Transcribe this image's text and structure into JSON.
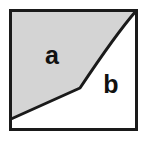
{
  "figure": {
    "canvas": {
      "width": 146,
      "height": 143
    },
    "background_color": "#ffffff",
    "frame": {
      "name": "bounding-box",
      "stroke_color": "#1a1a1a",
      "stroke_width": 3,
      "x": 10.5,
      "y": 10.5,
      "width": 126,
      "height": 119
    },
    "divider": {
      "name": "region-boundary-curve",
      "stroke_color": "#1a1a1a",
      "stroke_width": 3,
      "description": "Curve from top-right corner sweeping down-left to a kink, then a straight segment to the left edge",
      "path": "M 136 11 C 116 34, 96 64, 80 88 L 11 119",
      "kink_point": {
        "x": 80,
        "y": 88
      },
      "start_point": {
        "x": 136,
        "y": 11
      },
      "end_point": {
        "x": 11,
        "y": 119
      }
    },
    "regions": [
      {
        "id": "a",
        "label": "a",
        "fill_color": "#d4d4d4",
        "position": "upper-left",
        "label_x": 52,
        "label_y": 57,
        "path": "M 11 11 L 136 11 C 116 34, 96 64, 80 88 L 11 119 Z"
      },
      {
        "id": "b",
        "label": "b",
        "fill_color": "#ffffff",
        "position": "lower-right",
        "label_x": 111,
        "label_y": 86,
        "path": "M 136 11 L 136 129 L 11 129 L 11 119 L 80 88 C 96 64, 116 34, 136 11 Z"
      }
    ]
  }
}
